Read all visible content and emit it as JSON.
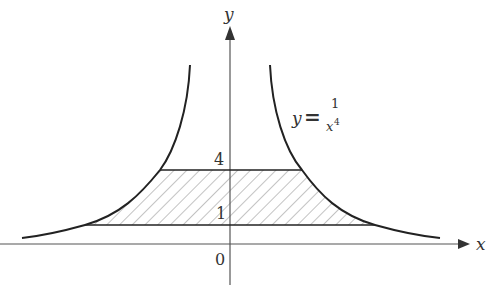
{
  "figure": {
    "axes": {
      "x_label": "x",
      "y_label": "y",
      "origin_label": "0"
    },
    "equation": {
      "lhs": "y",
      "eq": "=",
      "numerator": "1",
      "denominator": "x",
      "exponent": "4"
    },
    "y_ticks": [
      {
        "label": "4",
        "value": 4
      },
      {
        "label": "1",
        "value": 1
      }
    ],
    "shaded_region": {
      "description": "region between y=1 and y=4 bounded by curve y=1/x^4",
      "y_min": 1,
      "y_max": 4,
      "fill": "diagonal hatch"
    },
    "colors": {
      "curve": "#222222",
      "axis": "#555555",
      "hatch": "#888888"
    }
  }
}
